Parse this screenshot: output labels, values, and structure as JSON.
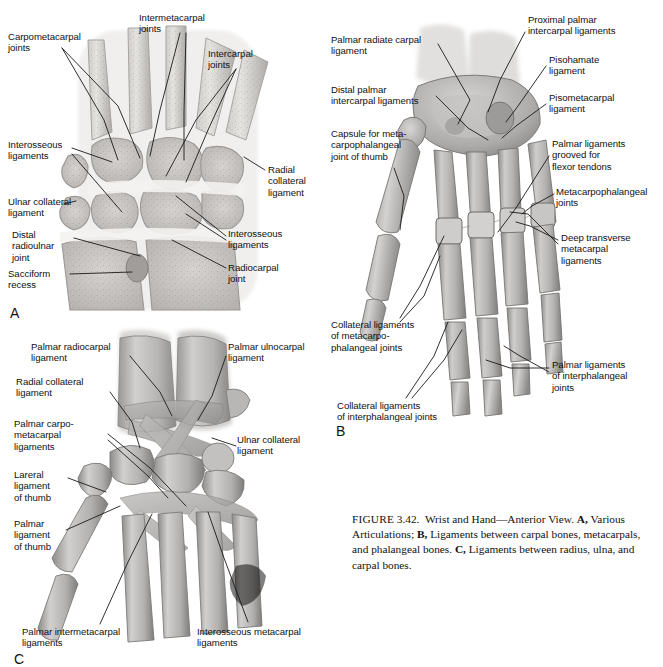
{
  "figure": {
    "number_label": "FIGURE",
    "number": "3.42.",
    "title": "Wrist and Hand—Anterior View.",
    "part_a_letter": "A,",
    "part_a_text": "Various Articulations;",
    "part_b_letter": "B,",
    "part_b_text": "Ligaments between carpal bones, metacarpals, and phalangeal bones.",
    "part_c_letter": "C,",
    "part_c_text": "Ligaments between radius, ulna, and carpal bones."
  },
  "panels": {
    "a": {
      "letter": "A",
      "labels": [
        {
          "id": "carpometacarpal-joints",
          "text": "Carpometacarpal\njoints",
          "x": 8,
          "y": 31,
          "align": "left"
        },
        {
          "id": "intermetacarpal-joints",
          "text": "Intermetacarpal\njoints",
          "x": 139,
          "y": 12,
          "align": "left"
        },
        {
          "id": "intercarpal-joints",
          "text": "Intercarpal\njoints",
          "x": 208,
          "y": 48,
          "align": "left"
        },
        {
          "id": "interosseous-ligaments-left",
          "text": "Interosseous\nligaments",
          "x": 8,
          "y": 139,
          "align": "left"
        },
        {
          "id": "ulnar-collateral-ligament",
          "text": "Ulnar collateral\nligament",
          "x": 8,
          "y": 196,
          "align": "left"
        },
        {
          "id": "distal-radioulnar-joint",
          "text": "Distal\nradioulnar\njoint",
          "x": 12,
          "y": 229,
          "align": "left"
        },
        {
          "id": "sacciform-recess",
          "text": "Sacciform\nrecess",
          "x": 8,
          "y": 268,
          "align": "left"
        },
        {
          "id": "radial-collateral-ligament",
          "text": "Radial\ncollateral\nligament",
          "x": 268,
          "y": 164,
          "align": "left"
        },
        {
          "id": "interosseous-ligaments-right",
          "text": "Interosseous\nligaments",
          "x": 228,
          "y": 228,
          "align": "left"
        },
        {
          "id": "radiocarpal-joint",
          "text": "Radiocarpal\njoint",
          "x": 228,
          "y": 262,
          "align": "left"
        }
      ]
    },
    "b": {
      "letter": "B",
      "labels": [
        {
          "id": "palmar-radiate-carpal-ligament",
          "text": "Palmar radiate carpal\nligament",
          "x": 331,
          "y": 34,
          "align": "left"
        },
        {
          "id": "proximal-palmar-intercarpal-ligaments",
          "text": "Proximal palmar\nintercarpal ligaments",
          "x": 528,
          "y": 14,
          "align": "left"
        },
        {
          "id": "pisohamate-ligament",
          "text": "Pisohamate\nligament",
          "x": 549,
          "y": 54,
          "align": "left"
        },
        {
          "id": "distal-palmar-intercarpal-ligaments",
          "text": "Distal palmar\nintercarpal ligaments",
          "x": 331,
          "y": 84,
          "align": "left"
        },
        {
          "id": "pisometacarpal-ligament",
          "text": "Pisometacarpal\nligament",
          "x": 549,
          "y": 92,
          "align": "left"
        },
        {
          "id": "capsule-for-mcp-joint-of-thumb",
          "text": "Capsule for meta-\ncarpophalangeal\njoint of thumb",
          "x": 331,
          "y": 128,
          "align": "left"
        },
        {
          "id": "palmar-ligaments-grooved-flexor-tendons",
          "text": "Palmar ligaments\ngrooved for\nflexor tendons",
          "x": 552,
          "y": 138,
          "align": "left"
        },
        {
          "id": "metacarpophalangeal-joints",
          "text": "Metacarpophalangeal\njoints",
          "x": 556,
          "y": 186,
          "align": "left"
        },
        {
          "id": "deep-transverse-metacarpal-ligaments",
          "text": "Deep transverse\nmetacarpal\nligaments",
          "x": 561,
          "y": 232,
          "align": "left"
        },
        {
          "id": "collateral-ligaments-of-mcp-joints",
          "text": "Collateral ligaments\nof metacarpo-\nphalangeal joints",
          "x": 331,
          "y": 319,
          "align": "left"
        },
        {
          "id": "palmar-ligaments-of-ip-joints",
          "text": "Palmar ligaments\nof interphalangeal\njoints",
          "x": 552,
          "y": 359,
          "align": "left"
        },
        {
          "id": "collateral-ligaments-of-ip-joints",
          "text": "Collateral ligaments\nof interphalangeal joints",
          "x": 337,
          "y": 400,
          "align": "left"
        }
      ]
    },
    "c": {
      "letter": "C",
      "labels": [
        {
          "id": "palmar-radiocarpal-ligament",
          "text": "Palmar radiocarpal\nligament",
          "x": 31,
          "y": 341,
          "align": "left"
        },
        {
          "id": "palmar-ulnocarpal-ligament",
          "text": "Palmar ulnocarpal\nligament",
          "x": 228,
          "y": 341,
          "align": "left"
        },
        {
          "id": "radial-collateral-ligament-c",
          "text": "Radial collateral\nligament",
          "x": 16,
          "y": 376,
          "align": "left"
        },
        {
          "id": "palmar-carpometacarpal-ligaments",
          "text": "Palmar carpo-\nmetacarpal\nligaments",
          "x": 14,
          "y": 418,
          "align": "left"
        },
        {
          "id": "ulnar-collateral-ligament-c",
          "text": "Ulnar collateral\nligament",
          "x": 237,
          "y": 434,
          "align": "left"
        },
        {
          "id": "lareral-ligament-of-thumb",
          "text": "Lareral\nligament\nof thumb",
          "x": 14,
          "y": 469,
          "align": "left"
        },
        {
          "id": "palmar-ligament-of-thumb",
          "text": "Palmar\nligament\nof thumb",
          "x": 14,
          "y": 518,
          "align": "left"
        },
        {
          "id": "palmar-intermetacarpal-ligaments",
          "text": "Palmar intermetacarpal\nligaments",
          "x": 22,
          "y": 626,
          "align": "left"
        },
        {
          "id": "interosseous-metacarpal-ligaments",
          "text": "Interosseous metacarpal\nligaments",
          "x": 197,
          "y": 626,
          "align": "left"
        }
      ]
    }
  },
  "colors": {
    "background": "#ffffff",
    "text": "#111111",
    "leader_line": "#1a1a1a",
    "bone_light": "#e9e7e5",
    "bone_mid": "#b9b6b3",
    "bone_dark": "#8e8b88",
    "bone_shadow": "#6f6d6b",
    "cartilage": "#f2f1ef"
  }
}
